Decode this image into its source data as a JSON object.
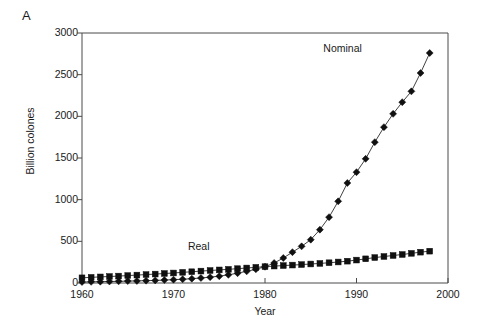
{
  "panel": {
    "label": "A"
  },
  "chart_data": {
    "type": "line",
    "title": "",
    "xlabel": "Year",
    "ylabel": "Billion colones",
    "xlim": [
      1960,
      2000
    ],
    "ylim": [
      0,
      3000
    ],
    "xticks": [
      1960,
      1970,
      1980,
      1990,
      2000
    ],
    "xtick_labels": [
      "1960",
      "1970",
      "1980",
      "1990",
      "2000"
    ],
    "yticks": [
      0,
      500,
      1000,
      1500,
      2000,
      2500,
      3000
    ],
    "ytick_labels": [
      "0",
      "500",
      "1000",
      "1500",
      "2000",
      "2500",
      "3000"
    ],
    "grid": false,
    "legend_position": "inline-annotations",
    "annotations": [
      {
        "text": "Nominal",
        "x": 1989.0,
        "y": 2810
      },
      {
        "text": "Real",
        "x": 1974.2,
        "y": 430
      }
    ],
    "x": [
      1960,
      1961,
      1962,
      1963,
      1964,
      1965,
      1966,
      1967,
      1968,
      1969,
      1970,
      1971,
      1972,
      1973,
      1974,
      1975,
      1976,
      1977,
      1978,
      1979,
      1980,
      1981,
      1982,
      1983,
      1984,
      1985,
      1986,
      1987,
      1988,
      1989,
      1990,
      1991,
      1992,
      1993,
      1994,
      1995,
      1996,
      1997,
      1998
    ],
    "series": [
      {
        "name": "Nominal",
        "marker": "diamond",
        "color": "#101010",
        "values": [
          12,
          14,
          16,
          18,
          20,
          23,
          25,
          28,
          31,
          35,
          40,
          45,
          52,
          60,
          70,
          82,
          98,
          118,
          140,
          165,
          195,
          240,
          300,
          370,
          440,
          520,
          640,
          790,
          980,
          1200,
          1330,
          1490,
          1690,
          1870,
          2030,
          2170,
          2300,
          2520,
          2760
        ]
      },
      {
        "name": "Real",
        "marker": "square",
        "color": "#101010",
        "values": [
          62,
          68,
          73,
          78,
          83,
          89,
          95,
          101,
          107,
          114,
          120,
          128,
          135,
          143,
          150,
          157,
          164,
          172,
          180,
          188,
          196,
          203,
          209,
          215,
          221,
          228,
          235,
          243,
          252,
          262,
          275,
          290,
          305,
          318,
          330,
          342,
          356,
          370,
          382
        ]
      }
    ]
  }
}
